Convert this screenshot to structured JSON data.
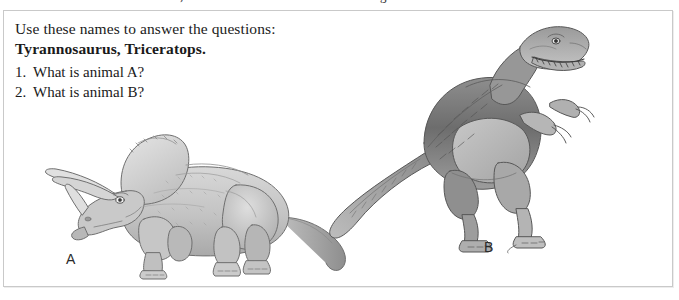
{
  "page": {
    "width": 679,
    "height": 300,
    "background": "#ffffff",
    "border_color": "#c9c9c9"
  },
  "clipped_text_above": "descender fragments of a previous line (illegible)",
  "worksheet": {
    "instructions": {
      "line1": "Use these names to answer the questions:",
      "line2": "Tyrannosaurus, Triceratops."
    },
    "questions": [
      {
        "number": "1.",
        "text": "What is animal A?"
      },
      {
        "number": "2.",
        "text": "What is animal B?"
      }
    ],
    "figures": [
      {
        "id": "triceratops",
        "label": "A",
        "description": "Pencil-style drawing of a quadrupedal horned dinosaur with a large neck frill, two long brow horns, a nose horn, facing left.",
        "ink": "#6f6f6f",
        "fill": "#cfcfcf"
      },
      {
        "id": "tyrannosaurus",
        "label": "B",
        "description": "Pencil-style drawing of a bipedal theropod dinosaur with a large toothed head, tiny two-fingered arms and a long tail, facing right.",
        "ink": "#575757",
        "fill": "#b5b5b5"
      }
    ]
  }
}
